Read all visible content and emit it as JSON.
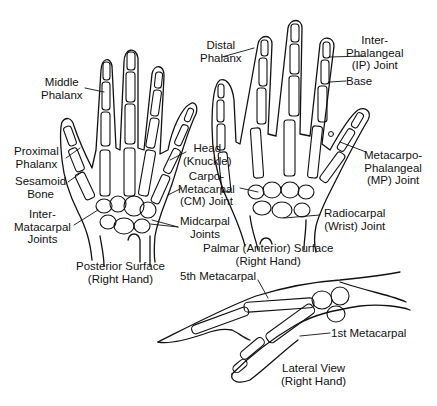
{
  "figure": {
    "type": "anatomical-line-drawing",
    "views": [
      {
        "id": "posterior",
        "caption": "Posterior Surface\n(Right Hand)",
        "labels": [
          {
            "id": "middle-phalanx",
            "text": "Middle\nPhalanx"
          },
          {
            "id": "proximal-phalanx",
            "text": "Proximal\nPhalanx"
          },
          {
            "id": "sesamoid-bone",
            "text": "Sesamoid\nBone"
          },
          {
            "id": "intermetacarpal-joints",
            "text": "Inter-\nMatacarpal\nJoints"
          },
          {
            "id": "head-knuckle",
            "text": "Head\n(Knuckle)"
          },
          {
            "id": "cm-joint",
            "text": "Carpo-\nMetacarpal\n(CM) Joint"
          },
          {
            "id": "midcarpal-joints",
            "text": "Midcarpal\nJoints"
          }
        ]
      },
      {
        "id": "palmar",
        "caption": "Palmar (Anterior) Surface\n(Right Hand)",
        "labels": [
          {
            "id": "distal-phalanx",
            "text": "Distal\nPhalanx"
          },
          {
            "id": "ip-joint",
            "text": "Inter-\nPhalangeal\n(IP) Joint"
          },
          {
            "id": "base",
            "text": "Base"
          },
          {
            "id": "mp-joint",
            "text": "Metacarpo-\nPhalangeal\n(MP) Joint"
          },
          {
            "id": "radiocarpal-joint",
            "text": "Radiocarpal\n(Wrist) Joint"
          }
        ]
      },
      {
        "id": "lateral",
        "caption": "Lateral View\n(Right Hand)",
        "labels": [
          {
            "id": "fifth-metacarpal",
            "text": "5th Metacarpal"
          },
          {
            "id": "first-metacarpal",
            "text": "1st Metacarpal"
          }
        ]
      }
    ]
  },
  "labels": {
    "middle_phalanx": "Middle\nPhalanx",
    "proximal_phalanx": "Proximal\nPhalanx",
    "sesamoid_bone": "Sesamoid\nBone",
    "intermetacarpal_joints": "Inter-\nMatacarpal\nJoints",
    "head_knuckle": "Head\n(Knuckle)",
    "cm_joint": "Carpo-\nMetacarpal\n(CM) Joint",
    "midcarpal_joints": "Midcarpal\nJoints",
    "posterior_caption": "Posterior Surface\n(Right Hand)",
    "distal_phalanx": "Distal\nPhalanx",
    "ip_joint": "Inter-\nPhalangeal\n(IP) Joint",
    "base": "Base",
    "mp_joint": "Metacarpo-\nPhalangeal\n(MP) Joint",
    "radiocarpal_joint": "Radiocarpal\n(Wrist) Joint",
    "palmar_caption": "Palmar (Anterior) Surface\n(Right Hand)",
    "fifth_metacarpal": "5th Metacarpal",
    "first_metacarpal": "1st Metacarpal",
    "lateral_caption": "Lateral View\n(Right Hand)"
  },
  "colors": {
    "ink": "#111111",
    "background": "#ffffff"
  }
}
